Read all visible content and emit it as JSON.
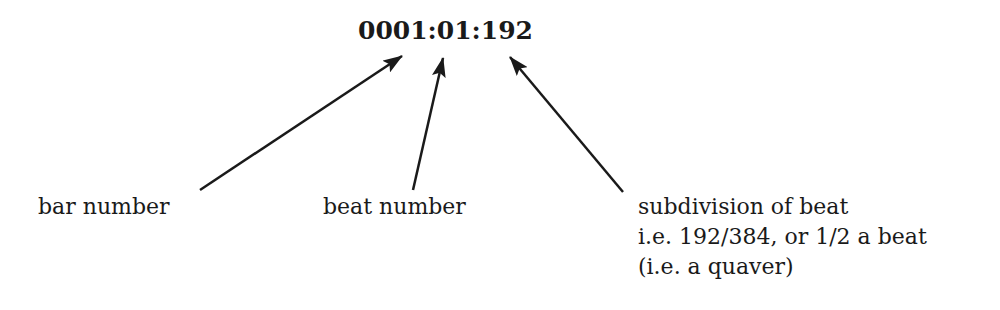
{
  "timecode": "0001:01:192",
  "labels": {
    "bar": "bar number",
    "beat": "beat number",
    "subdivision": [
      "subdivision of beat",
      "i.e. 192/384, or 1/2 a beat",
      "(i.e. a quaver)"
    ]
  },
  "colors": {
    "ink": "#1a1a1a",
    "background": "#ffffff"
  }
}
